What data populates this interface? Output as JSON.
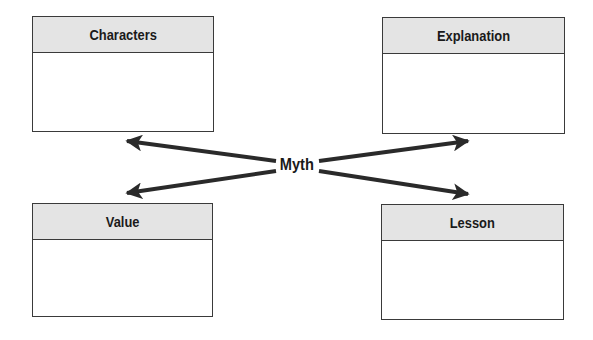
{
  "diagram": {
    "center": {
      "label": "Myth"
    },
    "boxes": [
      {
        "id": "characters",
        "title": "Characters",
        "position": "top-left",
        "body": ""
      },
      {
        "id": "explanation",
        "title": "Explanation",
        "position": "top-right",
        "body": ""
      },
      {
        "id": "value",
        "title": "Value",
        "position": "bottom-left",
        "body": ""
      },
      {
        "id": "lesson",
        "title": "Lesson",
        "position": "bottom-right",
        "body": ""
      }
    ],
    "connections": [
      {
        "from": "Myth",
        "to": "Characters",
        "style": "arrow"
      },
      {
        "from": "Myth",
        "to": "Explanation",
        "style": "arrow"
      },
      {
        "from": "Myth",
        "to": "Value",
        "style": "arrow"
      },
      {
        "from": "Myth",
        "to": "Lesson",
        "style": "arrow"
      }
    ],
    "colors": {
      "header_fill": "#e4e4e4",
      "border": "#3a3a3a",
      "arrow": "#2a2a2a",
      "text": "#1a1a1a"
    }
  }
}
